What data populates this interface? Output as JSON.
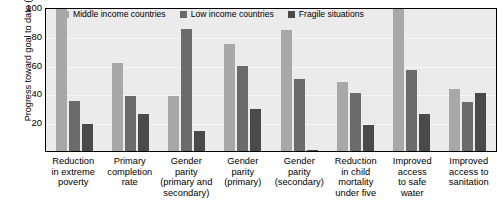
{
  "chart_data": {
    "type": "bar",
    "title": "",
    "subtitle": "",
    "xlabel": "",
    "ylabel": "Progress toward goal to date (%)",
    "ylim": [
      0,
      100
    ],
    "yticks": [
      100,
      80,
      60,
      40,
      20
    ],
    "grid": true,
    "legend_position": "top-inside",
    "categories": [
      "Reduction\nin extreme\npoverty",
      "Primary\ncompletion\nrate",
      "Gender\nparity\n(primary and\nsecondary)",
      "Gender\nparity\n(primary)",
      "Gender\nparity\n(secondary)",
      "Reduction\nin child\nmortality\nunder five",
      "Improved\naccess\nto safe\nwater",
      "Improved\naccess to\nsanitation"
    ],
    "series": [
      {
        "name": "Middle income countries",
        "color": "#a8a8a8",
        "values": [
          100,
          61,
          38,
          74,
          84,
          48,
          100,
          43
        ]
      },
      {
        "name": "Low income countries",
        "color": "#6b6b6b",
        "values": [
          35,
          38,
          85,
          59,
          50,
          40,
          56,
          34
        ]
      },
      {
        "name": "Fragile situations",
        "color": "#4a4a4a",
        "values": [
          19,
          26,
          14,
          29,
          1,
          18,
          26,
          40
        ]
      }
    ]
  }
}
